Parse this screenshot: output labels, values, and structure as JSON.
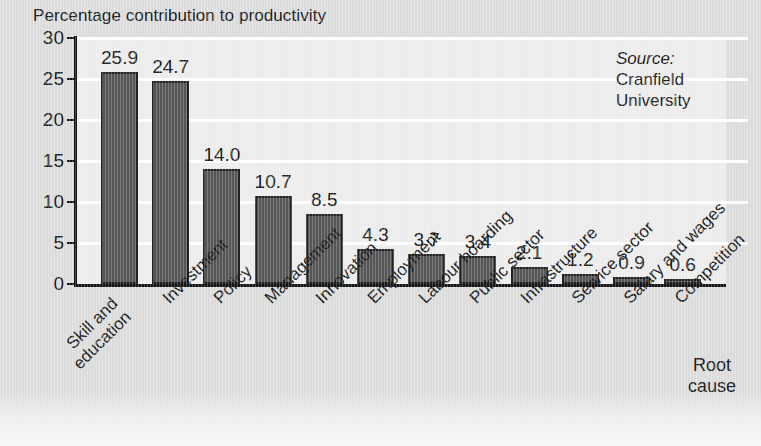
{
  "chart_data": {
    "type": "bar",
    "title": "Percentage contribution to productivity",
    "xlabel": "Root cause",
    "ylabel": "",
    "categories": [
      "Skill and education",
      "Investment",
      "Policy",
      "Management",
      "Innovation",
      "Employment",
      "Labour hoarding",
      "Public sector",
      "Infrastructure",
      "Service sector",
      "Salary and wages",
      "Competition"
    ],
    "values": [
      25.9,
      24.7,
      14.0,
      10.7,
      8.5,
      4.3,
      3.7,
      3.4,
      2.1,
      1.2,
      0.9,
      0.6
    ],
    "value_labels": [
      "25.9",
      "24.7",
      "14.0",
      "10.7",
      "8.5",
      "4.3",
      "3.7",
      "3.4",
      "2.1",
      "1.2",
      "0.9",
      "0.6"
    ],
    "ylim": [
      0,
      30
    ],
    "yticks": [
      0,
      5,
      10,
      15,
      20,
      25,
      30
    ],
    "ytick_labels": [
      "0",
      "5",
      "10",
      "15",
      "20",
      "25",
      "30"
    ],
    "grid": "horizontal",
    "legend": "none",
    "annotations": {
      "source_label": "Source:",
      "source_line1": "Cranfield",
      "source_line2": "University"
    },
    "colors": {
      "bar_fill": "#565656",
      "bar_stroke": "#232323",
      "plot_background": "#ececec",
      "page_background": "#dcdcdc",
      "gridline": "#ffffff",
      "axis": "#141414",
      "text": "#1a1a1a"
    }
  },
  "category_label_lines": [
    [
      "Skill and",
      "education"
    ],
    [
      "Investment"
    ],
    [
      "Policy"
    ],
    [
      "Management"
    ],
    [
      "Innovation"
    ],
    [
      "Employment"
    ],
    [
      "Labour hoarding"
    ],
    [
      "Public sector"
    ],
    [
      "Infrastructure"
    ],
    [
      "Service sector"
    ],
    [
      "Salary and wages"
    ],
    [
      "Competition"
    ]
  ],
  "axis_title_lines": [
    "Root",
    "cause"
  ]
}
